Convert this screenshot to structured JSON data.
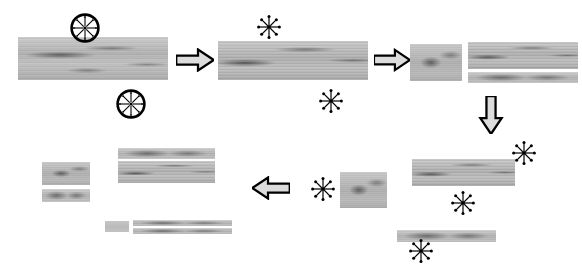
{
  "figure": {
    "background_color": "#ffffff",
    "wood_color": "#b9b9b9",
    "line_color": "#000000"
  },
  "symbols": {
    "circled_star": {
      "name": "circled-starburst-symbol",
      "meaning": "saw-blade-marker",
      "rays": 8
    },
    "star": {
      "name": "starburst-symbol",
      "meaning": "cut-location-marker",
      "rays": 8
    }
  },
  "arrows": {
    "right": {
      "label": "process-step-right",
      "direction": "right"
    },
    "down": {
      "label": "process-step-down",
      "direction": "down"
    },
    "left": {
      "label": "process-step-left",
      "direction": "left"
    }
  },
  "steps": [
    {
      "id": "step-1",
      "order": 1,
      "description": "Full log cant with two circled saw markers above and below",
      "pieces": [
        {
          "name": "cant-full",
          "x": 18,
          "y": 37,
          "w": 150,
          "h": 43,
          "style": "v1"
        }
      ],
      "markers": [
        {
          "type": "circled_star",
          "x": 70,
          "y": 13,
          "size": 30
        },
        {
          "type": "circled_star",
          "x": 116,
          "y": 89,
          "size": 30
        }
      ]
    },
    {
      "id": "step-2",
      "order": 2,
      "description": "Cant after first pass with starburst cut markers",
      "pieces": [
        {
          "name": "cant-trimmed",
          "x": 218,
          "y": 41,
          "w": 150,
          "h": 39,
          "style": "v2"
        }
      ],
      "markers": [
        {
          "type": "star",
          "x": 256,
          "y": 14,
          "size": 26
        },
        {
          "type": "star",
          "x": 318,
          "y": 88,
          "size": 26
        }
      ]
    },
    {
      "id": "step-3",
      "order": 3,
      "description": "Cant split into a side block and two stacked boards",
      "pieces": [
        {
          "name": "side-block",
          "x": 410,
          "y": 44,
          "w": 52,
          "h": 37,
          "style": "v3"
        },
        {
          "name": "board-upper",
          "x": 468,
          "y": 42,
          "w": 110,
          "h": 27,
          "style": "v2"
        },
        {
          "name": "board-lower",
          "x": 468,
          "y": 72,
          "w": 110,
          "h": 11,
          "style": "thin"
        }
      ],
      "markers": []
    },
    {
      "id": "step-4",
      "order": 4,
      "description": "Remaining cant on the right with three starburst cut markers and a thin board",
      "pieces": [
        {
          "name": "cant-right",
          "x": 412,
          "y": 159,
          "w": 103,
          "h": 27,
          "style": "v2"
        },
        {
          "name": "board-bottom",
          "x": 397,
          "y": 230,
          "w": 99,
          "h": 12,
          "style": "thin"
        }
      ],
      "markers": [
        {
          "type": "star",
          "x": 511,
          "y": 140,
          "size": 26
        },
        {
          "type": "star",
          "x": 450,
          "y": 190,
          "size": 26
        },
        {
          "type": "star",
          "x": 408,
          "y": 238,
          "size": 26
        }
      ]
    },
    {
      "id": "step-5",
      "order": 5,
      "description": "Intermediate block with a starburst marker on its left",
      "pieces": [
        {
          "name": "mid-block",
          "x": 340,
          "y": 172,
          "w": 47,
          "h": 36,
          "style": "v3"
        }
      ],
      "markers": [
        {
          "type": "star",
          "x": 310,
          "y": 176,
          "size": 26
        }
      ]
    },
    {
      "id": "step-6",
      "order": 6,
      "description": "Final sawn products: blocks, boards and thin battens",
      "pieces": [
        {
          "name": "product-block-a",
          "x": 42,
          "y": 162,
          "w": 48,
          "h": 23,
          "style": "v3"
        },
        {
          "name": "product-block-b",
          "x": 42,
          "y": 189,
          "w": 48,
          "h": 13,
          "style": "thin"
        },
        {
          "name": "product-board-a",
          "x": 118,
          "y": 148,
          "w": 97,
          "h": 11,
          "style": "thin"
        },
        {
          "name": "product-board-b",
          "x": 118,
          "y": 161,
          "w": 97,
          "h": 22,
          "style": "v2"
        },
        {
          "name": "product-stub",
          "x": 105,
          "y": 221,
          "w": 24,
          "h": 11,
          "style": "plain"
        },
        {
          "name": "product-batten-a",
          "x": 133,
          "y": 220,
          "w": 99,
          "h": 6,
          "style": "thin"
        },
        {
          "name": "product-batten-b",
          "x": 133,
          "y": 228,
          "w": 99,
          "h": 6,
          "style": "thin"
        }
      ],
      "markers": []
    }
  ],
  "flow_arrows": [
    {
      "name": "arrow-step1-to-step2",
      "direction": "right",
      "x": 176,
      "y": 48,
      "w": 38,
      "h": 24
    },
    {
      "name": "arrow-step2-to-step3",
      "direction": "right",
      "x": 374,
      "y": 48,
      "w": 36,
      "h": 24
    },
    {
      "name": "arrow-step3-to-step4",
      "direction": "down",
      "x": 478,
      "y": 96,
      "w": 26,
      "h": 38
    },
    {
      "name": "arrow-step5-to-step6",
      "direction": "left",
      "x": 252,
      "y": 176,
      "w": 38,
      "h": 24
    }
  ]
}
